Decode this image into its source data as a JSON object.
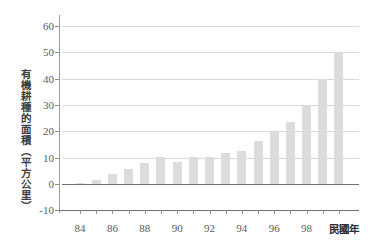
{
  "chart_data": {
    "type": "bar",
    "title": "",
    "subtitle": "",
    "xlabel": "民國年",
    "ylabel": "有機耕種的面積（平方公里）",
    "categories": [
      "84",
      "85",
      "86",
      "87",
      "88",
      "89",
      "90",
      "91",
      "92",
      "93",
      "94",
      "95",
      "96",
      "97",
      "98",
      "99",
      "100"
    ],
    "values": [
      0.2,
      1.5,
      3.7,
      5.6,
      7.8,
      10.1,
      8.3,
      10.2,
      10.2,
      11.8,
      12.6,
      16.5,
      19.8,
      23.6,
      29.7,
      39.8,
      50.0
    ],
    "ylim": [
      -10,
      62
    ],
    "yticks": [
      60,
      50,
      40,
      30,
      20,
      10,
      0,
      -10
    ],
    "ytick_labels": [
      "60",
      "50",
      "40",
      "30",
      "20",
      "10",
      "0",
      "-10"
    ],
    "xtick_labels": [
      "84",
      "86",
      "88",
      "90",
      "92",
      "94",
      "96",
      "98",
      "100"
    ],
    "grid": "horizontal",
    "legend": "none",
    "bar_color": "#dcdcdc",
    "grid_color": "#d8d8d8",
    "axis_color": "#6f6f6f",
    "text_color": "#5a5a5a"
  }
}
